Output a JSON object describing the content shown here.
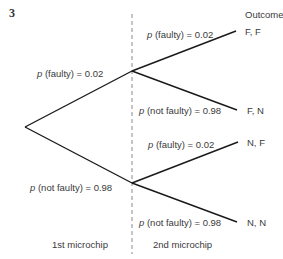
{
  "question_number": "3",
  "header": {
    "outcome_label": "Outcome"
  },
  "stages": {
    "first": "1st microchip",
    "second": "2nd microchip"
  },
  "branches": {
    "first_faulty": {
      "p": "p",
      "text": "(faulty) = 0.02"
    },
    "first_not_faulty": {
      "p": "p",
      "text": "(not faulty) = 0.98"
    },
    "second_ff": {
      "p": "p",
      "text": "(faulty) = 0.02"
    },
    "second_fn": {
      "p": "p",
      "text": "(not faulty) = 0.98"
    },
    "second_nf": {
      "p": "p",
      "text": "(faulty) = 0.02"
    },
    "second_nn": {
      "p": "p",
      "text": "(not faulty) = 0.98"
    }
  },
  "outcomes": [
    "F, F",
    "F, N",
    "N, F",
    "N, N"
  ],
  "colors": {
    "line": "#1a1a1a",
    "dash": "#8a8a8a",
    "text": "#3a3a3a"
  }
}
